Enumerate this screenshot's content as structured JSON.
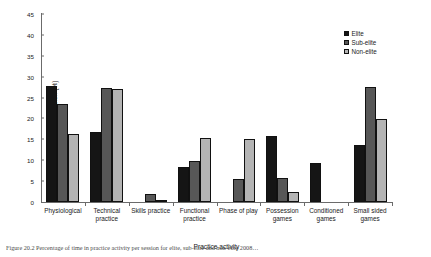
{
  "chart_data": {
    "type": "bar",
    "title": "",
    "xlabel": "Practice activity",
    "ylabel": "Time per session (%)",
    "ylim": [
      0,
      45
    ],
    "yticks": [
      0,
      5,
      10,
      15,
      20,
      25,
      30,
      35,
      40,
      45
    ],
    "grid": false,
    "legend_position": "top-right",
    "categories": [
      "Physiological",
      "Technical practice",
      "Skills practice",
      "Functional\npractice",
      "Phase of play",
      "Possession\ngames",
      "Conditioned\ngames",
      "Small sided\ngames"
    ],
    "series": [
      {
        "name": "Elite",
        "color": "#151515",
        "values": [
          27.8,
          16.7,
          0.0,
          8.5,
          0.0,
          15.9,
          9.4,
          13.7
        ]
      },
      {
        "name": "Sub-elite",
        "color": "#575757",
        "values": [
          23.5,
          27.3,
          1.8,
          9.8,
          5.4,
          5.8,
          0.0,
          27.6
        ]
      },
      {
        "name": "Non-elite",
        "color": "#b4b4b4",
        "values": [
          16.3,
          27.0,
          0.5,
          15.4,
          15.0,
          2.4,
          0.0,
          19.9
        ]
      }
    ]
  },
  "legend": {
    "items": [
      {
        "label": "Elite",
        "swatch": "legend-swatch-elite"
      },
      {
        "label": "Sub-elite",
        "swatch": "legend-swatch-sub-elite"
      },
      {
        "label": "Non-elite",
        "swatch": "legend-swatch-non-elite"
      }
    ]
  },
  "caption": {
    "text": "Figure 20.2  Percentage of time in practice activity per session for elite, sub-elite and non-elite 2008…"
  }
}
